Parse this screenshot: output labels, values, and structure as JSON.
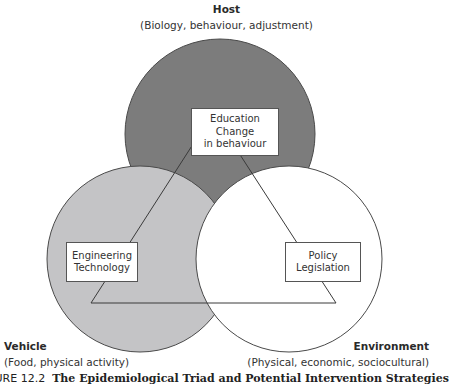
{
  "host": {
    "title": "Host",
    "subtitle": "(Biology, behaviour, adjustment)",
    "fill": "#7c7c7c"
  },
  "vehicle": {
    "title": "Vehicle",
    "subtitle": "(Food, physical activity)",
    "fill": "#c4c4c6"
  },
  "environment": {
    "title": "Environment",
    "subtitle": "(Physical, economic, sociocultural)",
    "fill": "#ffffff"
  },
  "boxes": {
    "education": {
      "line1": "Education",
      "line2": "Change",
      "line3": "in behaviour"
    },
    "engineering": {
      "line1": "Engineering",
      "line2": "Technology"
    },
    "policy": {
      "line1": "Policy",
      "line2": "Legislation"
    }
  },
  "caption": {
    "prefix": "GURE 12.2",
    "title": "The Epidemiological Triad and Potential Intervention Strategies"
  }
}
